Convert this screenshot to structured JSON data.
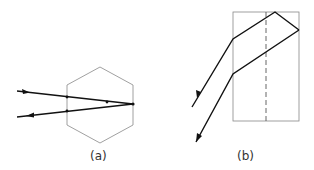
{
  "figures": [
    {
      "id": "a",
      "label": "(a)",
      "shape": "hexagon",
      "description": "Ray entering hexagonal prism and retro-reflecting"
    },
    {
      "id": "b",
      "label": "(b)",
      "shape": "rectangle",
      "description": "Ray entering rectangular prism with dashed axis and reflecting at corner"
    }
  ],
  "colors": {
    "shape_outline": "#888888",
    "ray": "#111111",
    "dashed": "#555555"
  }
}
